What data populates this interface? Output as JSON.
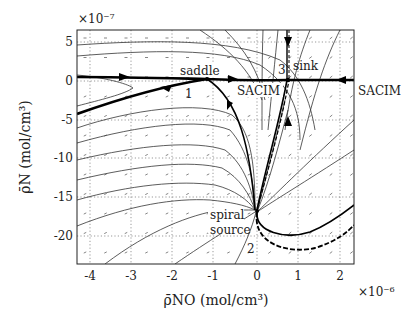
{
  "chart_data": {
    "type": "line",
    "subtype": "phase-portrait",
    "title": "",
    "xlabel": "ρ̄NO (mol/cm³)",
    "ylabel": "ρ̄N (mol/cm³)",
    "x_scale_label": "×10⁻⁶",
    "y_scale_label": "×10⁻⁷",
    "xlim": [
      -4.3,
      2.35
    ],
    "ylim": [
      -23.5,
      6.5
    ],
    "x_ticks": [
      -4,
      -3,
      -2,
      -1,
      0,
      1,
      2
    ],
    "y_ticks": [
      5,
      0,
      -5,
      -10,
      -15,
      -20
    ],
    "grid": true,
    "grid_style": "dotted",
    "annotations": [
      {
        "text": "saddle",
        "x": -1.55,
        "y": 1.8
      },
      {
        "text": "1",
        "x": -1.25,
        "y": -2.3
      },
      {
        "text": "SACIM",
        "x": -0.3,
        "y": -1.7
      },
      {
        "text": "3",
        "x": 0.6,
        "y": 2.5
      },
      {
        "text": "sink",
        "x": 0.95,
        "y": 3.0
      },
      {
        "text": "SACIM",
        "x": 2.65,
        "y": -1.7
      },
      {
        "text": "spiral",
        "x": -1.0,
        "y": -16.8
      },
      {
        "text": "source",
        "x": -1.0,
        "y": -19.2
      },
      {
        "text": "2",
        "x": -0.3,
        "y": -22.0
      }
    ],
    "equilibria": [
      {
        "id": 1,
        "type": "saddle",
        "x": -1.2,
        "y": 0.0
      },
      {
        "id": 2,
        "type": "spiral source",
        "x": -0.05,
        "y": -20.3
      },
      {
        "id": 3,
        "type": "sink",
        "x": 0.75,
        "y": 0.6
      }
    ],
    "series": [
      {
        "name": "SACIM",
        "style": "thick",
        "points": [
          [
            -4.3,
            0.6
          ],
          [
            -3,
            0.55
          ],
          [
            -2,
            0.45
          ],
          [
            -1.2,
            0.3
          ],
          [
            0,
            0.55
          ],
          [
            0.75,
            0.6
          ],
          [
            2.35,
            0.6
          ]
        ]
      },
      {
        "name": "saddle unstable manifold (left)",
        "style": "thick",
        "points": [
          [
            -1.2,
            0.3
          ],
          [
            -2.5,
            -1.5
          ],
          [
            -4.3,
            -4.3
          ]
        ]
      },
      {
        "name": "saddle stable manifold (from source)",
        "style": "thick",
        "points": [
          [
            -0.05,
            -20.3
          ],
          [
            -0.2,
            -12
          ],
          [
            -0.5,
            -5
          ],
          [
            -1.2,
            0.3
          ]
        ]
      },
      {
        "name": "source to sink",
        "style": "thick-dashed",
        "points": [
          [
            -0.05,
            -20.3
          ],
          [
            0.3,
            -12
          ],
          [
            0.6,
            -5
          ],
          [
            0.75,
            0.6
          ]
        ]
      },
      {
        "name": "sink from above",
        "style": "thick",
        "points": [
          [
            0.75,
            6.5
          ],
          [
            0.75,
            0.6
          ]
        ]
      },
      {
        "name": "source lower branch",
        "style": "thick",
        "points": [
          [
            -0.05,
            -20.3
          ],
          [
            0.2,
            -21.8
          ],
          [
            1.0,
            -20.8
          ],
          [
            2.35,
            -16.5
          ]
        ]
      },
      {
        "name": "source lower branch dashed",
        "style": "dashed",
        "points": [
          [
            -0.05,
            -20.3
          ],
          [
            0.1,
            -22.8
          ],
          [
            1.0,
            -22.5
          ],
          [
            2.35,
            -18.8
          ]
        ]
      }
    ]
  }
}
